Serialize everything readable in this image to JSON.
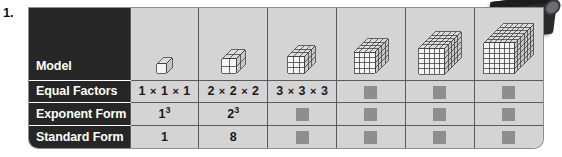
{
  "exercise": {
    "number": "1."
  },
  "table": {
    "row_labels": [
      "Model",
      "Equal Factors",
      "Exponent Form",
      "Standard Form"
    ],
    "columns": [
      {
        "model": {
          "type": "cube",
          "size": 1,
          "alt": "1 by 1 by 1 cube"
        },
        "equal_factors": "1 × 1 × 1",
        "exponent_form_base": "1",
        "exponent_form_exp": "3",
        "standard_form": "1",
        "filled": {
          "equal_factors": true,
          "exponent_form": true,
          "standard_form": true
        }
      },
      {
        "model": {
          "type": "cube",
          "size": 2,
          "alt": "2 by 2 by 2 cube"
        },
        "equal_factors": "2 × 2 × 2",
        "exponent_form_base": "2",
        "exponent_form_exp": "3",
        "standard_form": "8",
        "filled": {
          "equal_factors": true,
          "exponent_form": true,
          "standard_form": true
        }
      },
      {
        "model": {
          "type": "cube",
          "size": 3,
          "alt": "3 by 3 by 3 cube"
        },
        "equal_factors": "3 × 3 × 3",
        "exponent_form_base": "",
        "exponent_form_exp": "",
        "standard_form": "",
        "filled": {
          "equal_factors": true,
          "exponent_form": false,
          "standard_form": false
        }
      },
      {
        "model": {
          "type": "cube",
          "size": 4,
          "alt": "4 by 4 by 4 cube"
        },
        "equal_factors": "",
        "exponent_form_base": "",
        "exponent_form_exp": "",
        "standard_form": "",
        "filled": {
          "equal_factors": false,
          "exponent_form": false,
          "standard_form": false
        }
      },
      {
        "model": {
          "type": "cube",
          "size": 5,
          "alt": "5 by 5 by 5 cube"
        },
        "equal_factors": "",
        "exponent_form_base": "",
        "exponent_form_exp": "",
        "standard_form": "",
        "filled": {
          "equal_factors": false,
          "exponent_form": false,
          "standard_form": false
        }
      },
      {
        "model": {
          "type": "cube",
          "size": 6,
          "alt": "6 by 6 by 6 cube"
        },
        "equal_factors": "",
        "exponent_form_base": "",
        "exponent_form_exp": "",
        "standard_form": "",
        "filled": {
          "equal_factors": false,
          "exponent_form": false,
          "standard_form": false
        }
      }
    ]
  },
  "colors": {
    "label_column_bg": "#262626",
    "label_text": "#ffffff",
    "cell_bg": "#d4d4d4",
    "grid_line": "#5a5a5a",
    "placeholder_square": "#8e8e8e",
    "page_bg": "#ffffff",
    "artifact": "#2a2a2c"
  }
}
